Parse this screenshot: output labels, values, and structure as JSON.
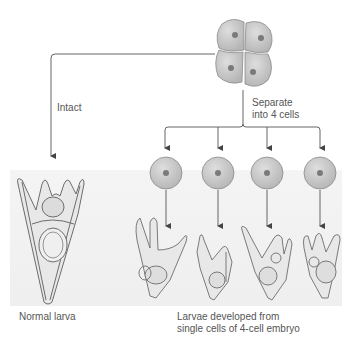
{
  "figure": {
    "type": "embryo-separation-diagram",
    "colors": {
      "cell_fill": "#c9c9c9",
      "cell_stroke": "#8a8a8a",
      "nucleus": "#7a7a7a",
      "line": "#555555",
      "band": "#f1f1f1",
      "larva_stroke": "#6d6d6d",
      "larva_fill": "#e6e6e6"
    },
    "top": {
      "embryo_label": "4-cell embryo",
      "cells": 4
    },
    "left_branch": {
      "label": "Intact",
      "result_caption": "Normal larva"
    },
    "right_branch": {
      "label_line1": "Separate",
      "label_line2": "into 4 cells",
      "single_cells": 4,
      "result_caption_line1": "Larvae developed from",
      "result_caption_line2": "single cells of 4-cell embryo"
    }
  }
}
